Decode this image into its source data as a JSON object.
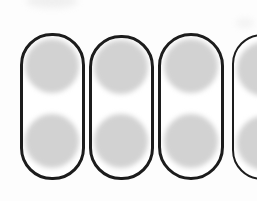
{
  "figure": {
    "background_color": "#fdfdfd",
    "outline_color": "#1c1c1c",
    "disc_color": "#d2d2d2",
    "shape_count_full": 3,
    "shape_count_partial": 1,
    "discs_per_shape": 2,
    "canvas": {
      "width": 257,
      "height": 201
    }
  },
  "shapes": [
    {
      "id": "capsule-1",
      "label": "Capsule 1",
      "x": 20,
      "y": 33,
      "width": 65,
      "height": 147,
      "border_width": 3,
      "corner_radius": 32,
      "discs": [
        {
          "label": "Capsule 1 top disc",
          "cx": 52,
          "cy": 66,
          "r": 27
        },
        {
          "label": "Capsule 1 bottom disc",
          "cx": 52,
          "cy": 141,
          "r": 27
        }
      ]
    },
    {
      "id": "capsule-2",
      "label": "Capsule 2",
      "x": 89,
      "y": 35,
      "width": 65,
      "height": 145,
      "border_width": 3,
      "corner_radius": 32,
      "discs": [
        {
          "label": "Capsule 2 top disc",
          "cx": 121,
          "cy": 67,
          "r": 27
        },
        {
          "label": "Capsule 2 bottom disc",
          "cx": 121,
          "cy": 141,
          "r": 27
        }
      ]
    },
    {
      "id": "capsule-3",
      "label": "Capsule 3",
      "x": 158,
      "y": 33,
      "width": 66,
      "height": 147,
      "border_width": 3,
      "corner_radius": 33,
      "discs": [
        {
          "label": "Capsule 3 top disc",
          "cx": 191,
          "cy": 66,
          "r": 27
        },
        {
          "label": "Capsule 3 bottom disc",
          "cx": 191,
          "cy": 141,
          "r": 27
        }
      ]
    }
  ],
  "partial_shape": {
    "id": "capsule-partial",
    "label": "Partially cropped capsule at right margin",
    "discs": [
      {
        "label": "Partial capsule top disc",
        "cx": 30,
        "cy": 33,
        "r": 27
      },
      {
        "label": "Partial capsule bottom disc",
        "cx": 30,
        "cy": 107,
        "r": 27
      }
    ]
  }
}
